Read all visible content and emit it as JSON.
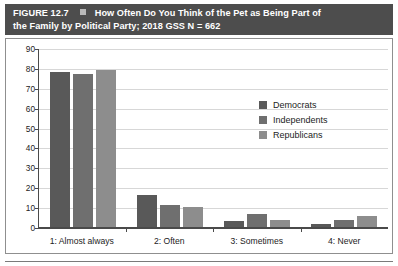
{
  "figure": {
    "label": "FIGURE 12.7",
    "title_line1": "How Often Do You Think of the Pet as Being Part of",
    "title_line2": "the Family by Political Party; 2018 GSS N = 662",
    "header_bg": "#4d4d4d",
    "header_square_color": "#b9b9b9"
  },
  "legend": {
    "items": [
      {
        "label": "Democrats",
        "color": "#595959"
      },
      {
        "label": "Independents",
        "color": "#6f6f6f"
      },
      {
        "label": "Republicans",
        "color": "#8d8d8d"
      }
    ]
  },
  "axes": {
    "y_ticks": [
      "0",
      "10",
      "20",
      "30",
      "40",
      "50",
      "60",
      "70",
      "80",
      "90"
    ],
    "x_labels": [
      "1: Almost always",
      "2: Often",
      "3: Sometimes",
      "4: Never"
    ]
  },
  "chart_data": {
    "type": "bar",
    "xlabel": "",
    "ylabel": "",
    "ylim": [
      0,
      90
    ],
    "ytick_step": 10,
    "grid": true,
    "legend_position": "top-right-inside",
    "categories": [
      "1: Almost always",
      "2: Often",
      "3: Sometimes",
      "4: Never"
    ],
    "series": [
      {
        "name": "Democrats",
        "color": "#595959",
        "values": [
          78,
          16,
          3,
          1.5
        ]
      },
      {
        "name": "Independents",
        "color": "#6f6f6f",
        "values": [
          77,
          11,
          6.5,
          3.5
        ]
      },
      {
        "name": "Republicans",
        "color": "#8d8d8d",
        "values": [
          79,
          10,
          3.5,
          5.5
        ]
      }
    ]
  }
}
